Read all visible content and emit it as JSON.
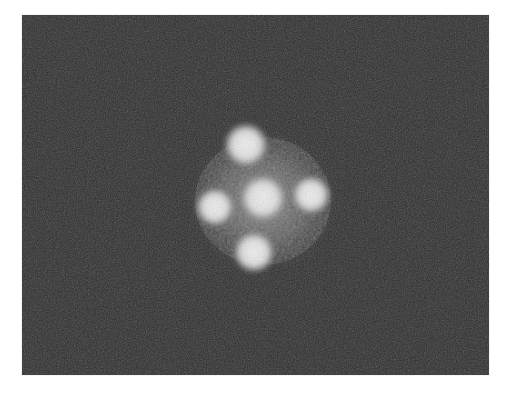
{
  "image": {
    "description": "Grayscale noisy photograph showing a cross-shaped pattern of five bright diffuse spots (four around a central one) on a dark background",
    "background_color": "#2a2a2a",
    "spot_color": "#e8e8e8",
    "spots": [
      {
        "name": "top",
        "cx": 224,
        "cy": 130,
        "r": 17
      },
      {
        "name": "left",
        "cx": 193,
        "cy": 192,
        "r": 15
      },
      {
        "name": "center",
        "cx": 241,
        "cy": 183,
        "r": 18
      },
      {
        "name": "right",
        "cx": 289,
        "cy": 180,
        "r": 15
      },
      {
        "name": "bottom",
        "cx": 232,
        "cy": 237,
        "r": 16
      }
    ],
    "halo": {
      "cx": 241,
      "cy": 186,
      "rx": 80,
      "ry": 75
    }
  }
}
